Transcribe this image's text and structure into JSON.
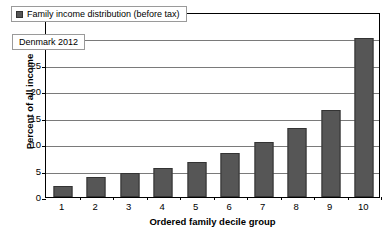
{
  "chart_data": {
    "type": "bar",
    "title": "",
    "categories": [
      "1",
      "2",
      "3",
      "4",
      "5",
      "6",
      "7",
      "8",
      "9",
      "10"
    ],
    "values": [
      2.1,
      3.7,
      4.5,
      5.5,
      6.7,
      8.3,
      10.5,
      13.0,
      16.5,
      30.0
    ],
    "series": [
      {
        "name": "Family income distribution (before tax)",
        "values": [
          2.1,
          3.7,
          4.5,
          5.5,
          6.7,
          8.3,
          10.5,
          13.0,
          16.5,
          30.0
        ]
      }
    ],
    "xlabel": "Ordered family decile group",
    "ylabel": "Percent of all income",
    "ylim": [
      0,
      35
    ],
    "yticks": [
      0,
      5,
      10,
      15,
      20,
      25,
      30,
      35
    ],
    "ytick_labels": [
      "0",
      "5",
      "10",
      "15",
      "20",
      "25",
      "30",
      "35"
    ],
    "grid": true,
    "legend": {
      "position": "top-left-inside",
      "entries": [
        {
          "label": "Family income distribution (before tax)",
          "color": "#565656"
        }
      ]
    },
    "annotations": [
      {
        "text": "Denmark 2012",
        "position": "top-left-inside"
      }
    ],
    "colors": {
      "bar_fill": "#565656",
      "bar_stroke": "#333333",
      "gridline": "#7a7a7a",
      "axis": "#000000",
      "background": "#ffffff"
    }
  }
}
